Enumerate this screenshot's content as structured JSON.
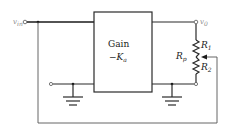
{
  "diagram": {
    "type": "circuit",
    "input_label": {
      "main": "v",
      "sub": "in"
    },
    "output_label": {
      "main": "v",
      "sub": "0"
    },
    "block": {
      "line1": "Gain",
      "line2_prefix": "−K",
      "line2_sub": "a"
    },
    "resistors": {
      "r1": {
        "main": "R",
        "sub": "1"
      },
      "r2": {
        "main": "R",
        "sub": "2"
      },
      "rp": {
        "main": "R",
        "sub": "p"
      }
    },
    "colors": {
      "wire": "#2a2a2a",
      "label": "#222222",
      "terminal_label": "#8a8a8a",
      "background": "#ffffff"
    }
  }
}
